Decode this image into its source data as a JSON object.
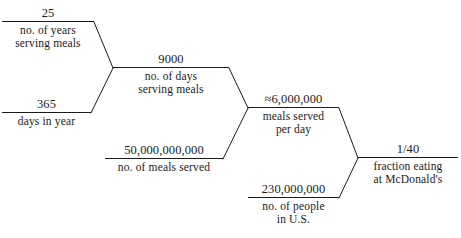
{
  "diagram": {
    "stroke_color": "#1a1a1a",
    "background_color": "#ffffff",
    "nodes": [
      {
        "id": "years-serving-meals",
        "value": "25",
        "label_line1": "no. of years",
        "label_line2": "serving meals"
      },
      {
        "id": "days-in-year",
        "value": "365",
        "label_line1": "days in year",
        "label_line2": ""
      },
      {
        "id": "days-serving-meals",
        "value": "9000",
        "label_line1": "no. of days",
        "label_line2": "serving meals"
      },
      {
        "id": "meals-served",
        "value": "50,000,000,000",
        "label_line1": "no. of meals served",
        "label_line2": ""
      },
      {
        "id": "meals-served-per-day",
        "value": "≈6,000,000",
        "label_line1": "meals served",
        "label_line2": "per day"
      },
      {
        "id": "people-in-us",
        "value": "230,000,000",
        "label_line1": "no. of people",
        "label_line2": "in U.S."
      },
      {
        "id": "fraction-eating",
        "value": "1/40",
        "label_line1": "fraction eating",
        "label_line2": "at McDonald's"
      }
    ],
    "edges": [
      {
        "from": "years-serving-meals",
        "to": "days-serving-meals"
      },
      {
        "from": "days-in-year",
        "to": "days-serving-meals"
      },
      {
        "from": "days-serving-meals",
        "to": "meals-served-per-day"
      },
      {
        "from": "meals-served",
        "to": "meals-served-per-day"
      },
      {
        "from": "meals-served-per-day",
        "to": "fraction-eating"
      },
      {
        "from": "people-in-us",
        "to": "fraction-eating"
      }
    ]
  }
}
